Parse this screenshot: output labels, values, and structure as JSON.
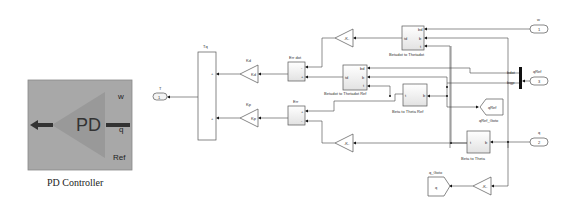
{
  "subsystem": {
    "name": "PD Controller",
    "icon_text": "PD",
    "ports_in": [
      "w",
      "q",
      "Ref"
    ],
    "colors": {
      "body": "#a8a8a8",
      "triangle": "#999999",
      "arrow": "#333333"
    }
  },
  "outports": [
    {
      "id": "T",
      "label": "T",
      "number": "1"
    }
  ],
  "inports": [
    {
      "id": "w",
      "label": "w",
      "number": "1"
    },
    {
      "id": "q",
      "label": "q",
      "number": "2"
    },
    {
      "id": "qRef",
      "label": "qRef",
      "number": "3"
    }
  ],
  "blocks": {
    "tq": {
      "label": "Tq",
      "signs": [
        "+",
        "+"
      ]
    },
    "kd": {
      "label": "Kd",
      "text": "Kd"
    },
    "kp": {
      "label": "Kp",
      "text": "Kp"
    },
    "err_dot": {
      "label": "Err dot",
      "signs": [
        "-",
        "+"
      ]
    },
    "err": {
      "label": "Err",
      "signs": [
        "+",
        "-"
      ]
    },
    "gain_upper": {
      "text": "-K-"
    },
    "gain_lower": {
      "text": "-K-"
    },
    "gain_bottom": {
      "text": "-K-"
    },
    "betadot_to_thetadot": {
      "label": "Betadot to Thetadot",
      "in_ports": [
        "bd",
        "b",
        "t"
      ],
      "out_port": "td"
    },
    "betadot_to_thetadot_ref": {
      "label": "Betadot to Thetadot Ref",
      "in_ports": [
        "bd",
        "b",
        "t"
      ],
      "out_port": "td"
    },
    "beta_to_theta_ref": {
      "label": "Beta to Theta Ref",
      "in_port": "b",
      "out_port": "t"
    },
    "beta_to_theta": {
      "label": "Beta to Theta",
      "in_port": "b",
      "out_port": "t"
    },
    "qref_goto": {
      "label": "qRef_Goto",
      "text": "qRef"
    },
    "q_goto": {
      "label": "q_Goto",
      "text": "q"
    },
    "demux": {
      "ports": [
        "bdot",
        "bigp"
      ]
    }
  }
}
